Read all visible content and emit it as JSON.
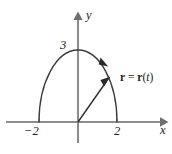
{
  "figure": {
    "name": "position-vector-semi-ellipse",
    "background_color": "#ffffff",
    "axes": {
      "x_label": "x",
      "y_label": "y",
      "axis_color": "#8d8d8d",
      "origin_px": [
        78,
        122
      ],
      "x_axis_span_px": [
        6,
        166
      ],
      "y_axis_span_px": [
        14,
        143
      ]
    },
    "ticks": {
      "x": [
        {
          "label": "−2",
          "value": -2,
          "px": 39
        },
        {
          "label": "2",
          "value": 2,
          "px": 117
        }
      ],
      "y": [
        {
          "label": "3",
          "value": 3,
          "px": 50
        }
      ]
    },
    "curve": {
      "description": "upper half of ellipse from (-2,0) to (2,0) with apex at (0,3)",
      "color": "#3b3b3b",
      "x_intercepts": [
        -2,
        2
      ],
      "apex": [
        0,
        3
      ],
      "direction_arrow": "clockwise"
    },
    "vector": {
      "label_plain": "r = r(t)",
      "label_bold_left": "r",
      "label_equals": " = ",
      "label_bold_right": "r",
      "label_paren_open": "(",
      "label_italic_arg": "t",
      "label_paren_close": ")",
      "color": "#2b2b2b",
      "tail": [
        0,
        0
      ],
      "tip_px": [
        108,
        80
      ]
    }
  }
}
